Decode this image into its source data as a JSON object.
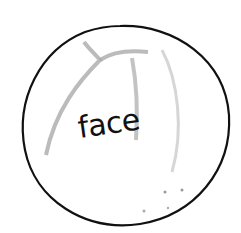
{
  "drawing": {
    "subject": "circle-sketch",
    "label": "face",
    "colors": {
      "outline": "#111111",
      "guide_lines": "#b0b0b0",
      "background": "#ffffff"
    }
  }
}
